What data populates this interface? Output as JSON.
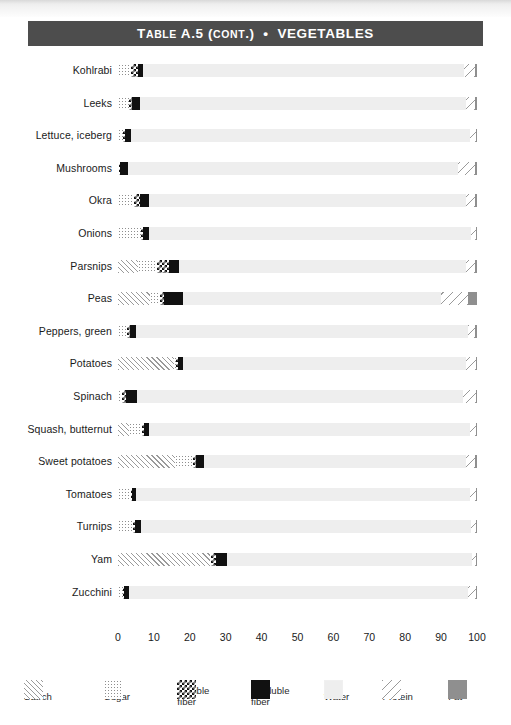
{
  "header": {
    "table_label": "Table",
    "table_number": "A.5",
    "cont": "(cont.)",
    "bullet": "•",
    "category": "VEGETABLES",
    "full_title": "TABLE A.5 (CONT.)  •  VEGETABLES",
    "bar_color": "#4d4d4d"
  },
  "legend": {
    "items": [
      {
        "key": "starch",
        "label": "Starch",
        "swatch": "diagonal-hatch-dense",
        "color": "#9a9a9a"
      },
      {
        "key": "sugar",
        "label": "Sugar",
        "swatch": "dotted",
        "color": "#8e8e8e"
      },
      {
        "key": "soluble",
        "label": "Soluble\nfiber",
        "swatch": "checkerboard",
        "color": "#111111"
      },
      {
        "key": "insoluble",
        "label": "Insoluble\nfiber",
        "swatch": "solid-black",
        "color": "#111111"
      },
      {
        "key": "water",
        "label": "Water",
        "swatch": "solid-light-gray",
        "color": "#eeeeee"
      },
      {
        "key": "protein",
        "label": "Protein",
        "swatch": "diagonal-hatch-sparse",
        "color": "#9a9a9a"
      },
      {
        "key": "fat",
        "label": "Fat",
        "swatch": "solid-gray",
        "color": "#8f8f8f"
      }
    ]
  },
  "chart_data": {
    "type": "bar",
    "subtype": "stacked-horizontal-100-percent",
    "title": "TABLE A.5 (CONT.)  •  VEGETABLES",
    "xlabel": "",
    "ylabel": "",
    "xlim": [
      0,
      100
    ],
    "xticks": [
      0,
      10,
      20,
      30,
      40,
      50,
      60,
      70,
      80,
      90,
      100
    ],
    "xtick_labels": [
      "0",
      "10",
      "20",
      "30",
      "40",
      "50",
      "60",
      "70",
      "80",
      "90",
      "100"
    ],
    "grid": false,
    "legend_position": "bottom",
    "series": [
      {
        "name": "Starch",
        "key": "starch"
      },
      {
        "name": "Sugar",
        "key": "sugar"
      },
      {
        "name": "Soluble fiber",
        "key": "soluble"
      },
      {
        "name": "Insoluble fiber",
        "key": "insoluble"
      },
      {
        "name": "Water",
        "key": "water"
      },
      {
        "name": "Protein",
        "key": "protein"
      },
      {
        "name": "Fat",
        "key": "fat"
      }
    ],
    "categories": [
      "Kohlrabi",
      "Leeks",
      "Lettuce, iceberg",
      "Mushrooms",
      "Okra",
      "Onions",
      "Parsnips",
      "Peas",
      "Peppers, green",
      "Potatoes",
      "Spinach",
      "Squash, butternut",
      "Sweet potatoes",
      "Tomatoes",
      "Turnips",
      "Yam",
      "Zucchini"
    ],
    "rows": [
      {
        "label": "Kohlrabi",
        "starch": 0,
        "sugar": 3.5,
        "soluble": 2.0,
        "insoluble": 1.5,
        "water": 89.5,
        "protein": 3.0,
        "fat": 0.5
      },
      {
        "label": "Leeks",
        "starch": 0,
        "sugar": 3.0,
        "soluble": 0.8,
        "insoluble": 2.2,
        "water": 91.0,
        "protein": 2.5,
        "fat": 0.5
      },
      {
        "label": "Lettuce, iceberg",
        "starch": 0,
        "sugar": 1.5,
        "soluble": 0.5,
        "insoluble": 1.5,
        "water": 94.5,
        "protein": 1.7,
        "fat": 0.3
      },
      {
        "label": "Mushrooms",
        "starch": 0,
        "sugar": 0.3,
        "soluble": 0.3,
        "insoluble": 2.2,
        "water": 92.0,
        "protein": 4.7,
        "fat": 0.5
      },
      {
        "label": "Okra",
        "starch": 0,
        "sugar": 4.5,
        "soluble": 1.6,
        "insoluble": 2.4,
        "water": 88.5,
        "protein": 2.5,
        "fat": 0.5
      },
      {
        "label": "Onions",
        "starch": 0,
        "sugar": 6.5,
        "soluble": 0.6,
        "insoluble": 1.6,
        "water": 89.5,
        "protein": 1.6,
        "fat": 0.2
      },
      {
        "label": "Parsnips",
        "starch": 5.5,
        "sugar": 5.5,
        "soluble": 3.3,
        "insoluble": 2.7,
        "water": 80.0,
        "protein": 2.5,
        "fat": 0.5
      },
      {
        "label": "Peas",
        "starch": 9.0,
        "sugar": 2.6,
        "soluble": 1.2,
        "insoluble": 5.2,
        "water": 72.0,
        "protein": 7.5,
        "fat": 2.5
      },
      {
        "label": "Peppers, green",
        "starch": 0,
        "sugar": 2.6,
        "soluble": 0.8,
        "insoluble": 1.6,
        "water": 92.5,
        "protein": 2.0,
        "fat": 0.5
      },
      {
        "label": "Potatoes",
        "starch": 15.5,
        "sugar": 0.6,
        "soluble": 0.5,
        "insoluble": 1.4,
        "water": 79.0,
        "protein": 2.7,
        "fat": 0.3
      },
      {
        "label": "Spinach",
        "starch": 0,
        "sugar": 1.2,
        "soluble": 0.9,
        "insoluble": 3.1,
        "water": 91.0,
        "protein": 3.4,
        "fat": 0.4
      },
      {
        "label": "Squash, butternut",
        "starch": 3.0,
        "sugar": 3.8,
        "soluble": 0.4,
        "insoluble": 1.3,
        "water": 89.5,
        "protein": 1.8,
        "fat": 0.2
      },
      {
        "label": "Sweet potatoes",
        "starch": 16.0,
        "sugar": 4.8,
        "soluble": 0.9,
        "insoluble": 2.3,
        "water": 73.0,
        "protein": 2.5,
        "fat": 0.5
      },
      {
        "label": "Tomatoes",
        "starch": 0,
        "sugar": 3.5,
        "soluble": 0.3,
        "insoluble": 1.2,
        "water": 93.0,
        "protein": 1.6,
        "fat": 0.4
      },
      {
        "label": "Turnips",
        "starch": 0,
        "sugar": 4.2,
        "soluble": 0.5,
        "insoluble": 1.6,
        "water": 92.0,
        "protein": 1.3,
        "fat": 0.4
      },
      {
        "label": "Yam",
        "starch": 25.5,
        "sugar": 0.5,
        "soluble": 1.2,
        "insoluble": 3.3,
        "water": 68.0,
        "protein": 1.3,
        "fat": 0.2
      },
      {
        "label": "Zucchini",
        "starch": 0,
        "sugar": 1.3,
        "soluble": 0.3,
        "insoluble": 1.4,
        "water": 94.5,
        "protein": 2.2,
        "fat": 0.3
      }
    ]
  }
}
